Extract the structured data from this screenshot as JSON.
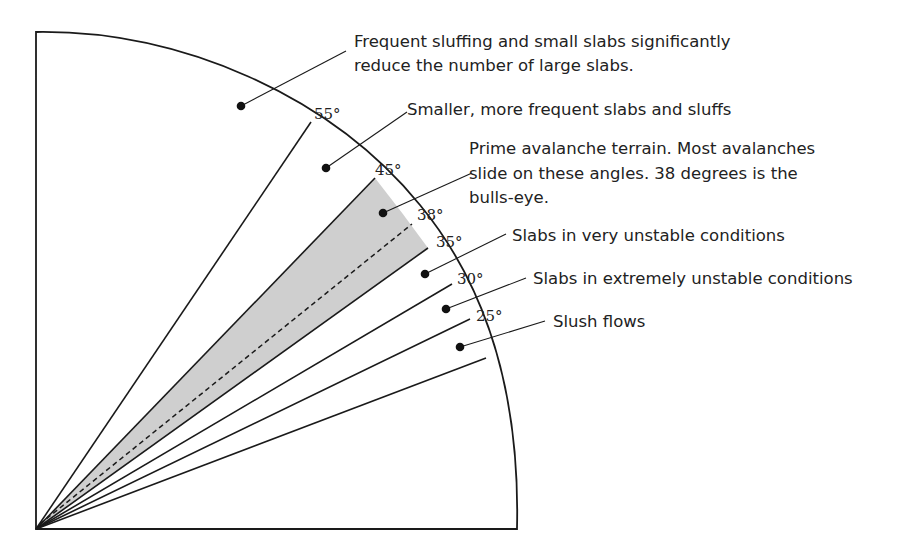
{
  "diagram": {
    "colors": {
      "line": "#1a1a1a",
      "prime_zone_fill": "#cfcfcf",
      "text": "#222222",
      "background": "#ffffff"
    },
    "angle_markers": [
      {
        "id": "a55",
        "label": "55°"
      },
      {
        "id": "a45",
        "label": "45°"
      },
      {
        "id": "a38",
        "label": "38°"
      },
      {
        "id": "a35",
        "label": "35°"
      },
      {
        "id": "a30",
        "label": "30°"
      },
      {
        "id": "a25",
        "label": "25°"
      }
    ],
    "zones": [
      {
        "id": "above-55",
        "range": "> 55°",
        "lines": [
          "Frequent sluffing and small slabs significantly",
          "reduce the number of large slabs."
        ]
      },
      {
        "id": "45-55",
        "range": "45°–55°",
        "lines": [
          "Smaller, more frequent slabs and sluffs"
        ]
      },
      {
        "id": "35-45",
        "range": "35°–45°",
        "highlighted": true,
        "lines": [
          "Prime avalanche terrain. Most avalanches",
          "slide on these angles. 38 degrees is the",
          "bulls-eye."
        ]
      },
      {
        "id": "30-35",
        "range": "30°–35°",
        "lines": [
          "Slabs in very unstable conditions"
        ]
      },
      {
        "id": "25-30",
        "range": "25°–30°",
        "lines": [
          "Slabs in extremely unstable conditions"
        ]
      },
      {
        "id": "below-25",
        "range": "< 25°",
        "lines": [
          "Slush flows"
        ]
      }
    ]
  }
}
